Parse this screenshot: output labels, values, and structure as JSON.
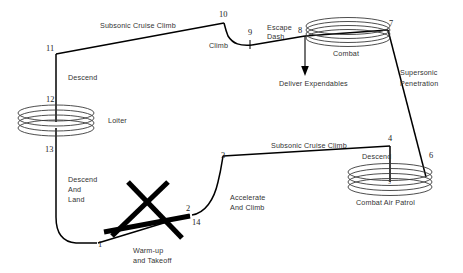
{
  "diagram": {
    "type": "mission-profile-flight-diagram",
    "colors": {
      "line": "#000000",
      "spiral": "#3a3a3a",
      "label_text": "#333333",
      "point_text": "#222222",
      "background": "#ffffff"
    },
    "segment_labels": {
      "subsonic_cruise_climb_top": "Subsonic Cruise Climb",
      "climb": "Climb",
      "escape_dash_line1": "Escape",
      "escape_dash_line2": "Dash",
      "combat": "Combat",
      "deliver_expendables": "Deliver Expendables",
      "supersonic_penetration_line1": "Supersonic",
      "supersonic_penetration_line2": "Penetration",
      "descend_top": "Descend",
      "loiter": "Loiter",
      "descend_and_land_line1": "Descend",
      "descend_and_land_line2": "And",
      "descend_and_land_line3": "Land",
      "warmup_takeoff_line1": "Warm-up",
      "warmup_takeoff_line2": "and Takeoff",
      "accelerate_and_climb_line1": "Accelerate",
      "accelerate_and_climb_line2": "And Climb",
      "subsonic_cruise_climb_bottom": "Subsonic Cruise Climb",
      "descend_cap": "Descend",
      "combat_air_patrol": "Combat Air Patrol"
    },
    "waypoints": [
      {
        "id": "1",
        "label": "1",
        "x": 98,
        "y": 247
      },
      {
        "id": "2",
        "label": "2",
        "x": 189,
        "y": 211
      },
      {
        "id": "3",
        "label": "3",
        "x": 224,
        "y": 158
      },
      {
        "id": "4",
        "label": "4",
        "x": 391,
        "y": 141
      },
      {
        "id": "5",
        "label": "5",
        "x": 392,
        "y": 183
      },
      {
        "id": "6",
        "label": "6",
        "x": 430,
        "y": 157
      },
      {
        "id": "7",
        "label": "7",
        "x": 389,
        "y": 24
      },
      {
        "id": "8",
        "label": "8",
        "x": 303,
        "y": 31
      },
      {
        "id": "9",
        "label": "9",
        "x": 251,
        "y": 35
      },
      {
        "id": "10",
        "label": "10",
        "x": 224,
        "y": 17
      },
      {
        "id": "11",
        "label": "11",
        "x": 51,
        "y": 48
      },
      {
        "id": "12",
        "label": "12",
        "x": 50,
        "y": 99
      },
      {
        "id": "13",
        "label": "13",
        "x": 49,
        "y": 151
      },
      {
        "id": "14",
        "label": "14",
        "x": 195,
        "y": 222
      }
    ]
  }
}
